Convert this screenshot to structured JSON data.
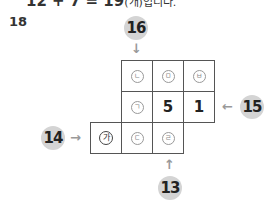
{
  "top_text": {
    "main": "12 + 7 = 19",
    "suffix": "(개)입니다."
  },
  "question_number": "18",
  "grid": {
    "rows": [
      {
        "cells": [
          {
            "col": 1,
            "type": "circled",
            "label": "ㄴ"
          },
          {
            "col": 2,
            "type": "circled",
            "label": "ㅁ"
          },
          {
            "col": 3,
            "type": "circled",
            "label": "ㅂ"
          }
        ]
      },
      {
        "cells": [
          {
            "col": 1,
            "type": "circled",
            "label": "ㄱ"
          },
          {
            "col": 2,
            "type": "value",
            "label": "5"
          },
          {
            "col": 3,
            "type": "value",
            "label": "1"
          }
        ]
      },
      {
        "cells": [
          {
            "col": 0,
            "type": "circled-dark",
            "label": "가"
          },
          {
            "col": 1,
            "type": "circled",
            "label": "ㄷ"
          },
          {
            "col": 2,
            "type": "circled",
            "label": "ㄹ"
          }
        ]
      }
    ]
  },
  "badges": {
    "top": "16",
    "right": "15",
    "left": "14",
    "bottom": "13"
  },
  "arrows": {
    "top": "↓",
    "right": "←",
    "left": "→",
    "bottom": "↑"
  },
  "colors": {
    "badge_bg": "#d4d4d4",
    "arrow": "#999999",
    "grid_line": "#555555"
  }
}
